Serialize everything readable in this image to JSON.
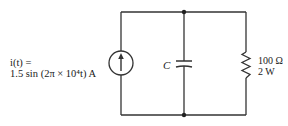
{
  "circuit": {
    "source": {
      "type": "current-source",
      "label_line1": "i(t) =",
      "label_line2": "1.5 sin (2π × 10⁴t) A",
      "amplitude": "1.5",
      "unit": "A",
      "expression": "1.5 sin (2π × 10⁴t) A"
    },
    "capacitor": {
      "type": "capacitor",
      "label": "C"
    },
    "resistor": {
      "type": "resistor",
      "resistance": "100 Ω",
      "power": "2 W"
    },
    "colors": {
      "wire": "#333333",
      "background": "#ffffff"
    }
  }
}
